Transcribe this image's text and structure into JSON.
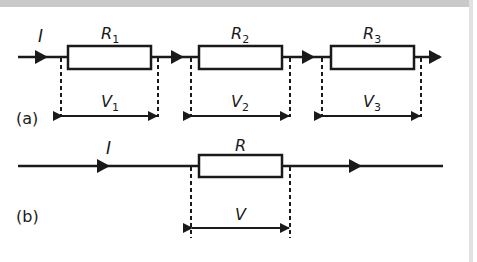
{
  "diagram": {
    "colors": {
      "line": "#1a1a1a",
      "background": "#ffffff",
      "border": "#c9c9c9"
    },
    "panel_a": {
      "label": "(a)",
      "current_label": "I",
      "resistors": [
        {
          "name": "R",
          "sub": "1",
          "voltage": "V",
          "vsub": "1"
        },
        {
          "name": "R",
          "sub": "2",
          "voltage": "V",
          "vsub": "2"
        },
        {
          "name": "R",
          "sub": "3",
          "voltage": "V",
          "vsub": "3"
        }
      ]
    },
    "panel_b": {
      "label": "(b)",
      "current_label": "I",
      "resistor": {
        "name": "R",
        "voltage": "V"
      }
    }
  }
}
